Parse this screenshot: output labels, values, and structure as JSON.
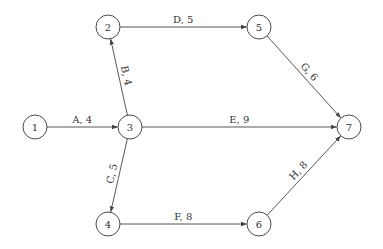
{
  "diagram": {
    "type": "activity-on-arrow network",
    "nodes": [
      {
        "id": "1",
        "label": "1",
        "x": 35,
        "y": 127
      },
      {
        "id": "2",
        "label": "2",
        "x": 108,
        "y": 27
      },
      {
        "id": "3",
        "label": "3",
        "x": 130,
        "y": 127
      },
      {
        "id": "4",
        "label": "4",
        "x": 108,
        "y": 224
      },
      {
        "id": "5",
        "label": "5",
        "x": 259,
        "y": 27
      },
      {
        "id": "6",
        "label": "6",
        "x": 259,
        "y": 224
      },
      {
        "id": "7",
        "label": "7",
        "x": 349,
        "y": 127
      }
    ],
    "edges": [
      {
        "from": "1",
        "to": "3",
        "activity": "A",
        "duration": 4,
        "label": "A, 4"
      },
      {
        "from": "3",
        "to": "2",
        "activity": "B",
        "duration": 4,
        "label": "B, 4"
      },
      {
        "from": "3",
        "to": "4",
        "activity": "C",
        "duration": 5,
        "label": "C, 5"
      },
      {
        "from": "2",
        "to": "5",
        "activity": "D",
        "duration": 5,
        "label": "D, 5"
      },
      {
        "from": "3",
        "to": "7",
        "activity": "E",
        "duration": 9,
        "label": "E, 9"
      },
      {
        "from": "4",
        "to": "6",
        "activity": "F",
        "duration": 8,
        "label": "F, 8"
      },
      {
        "from": "5",
        "to": "7",
        "activity": "G",
        "duration": 6,
        "label": "G, 6"
      },
      {
        "from": "6",
        "to": "7",
        "activity": "H",
        "duration": 8,
        "label": "H, 8"
      }
    ],
    "node_radius": 12
  }
}
